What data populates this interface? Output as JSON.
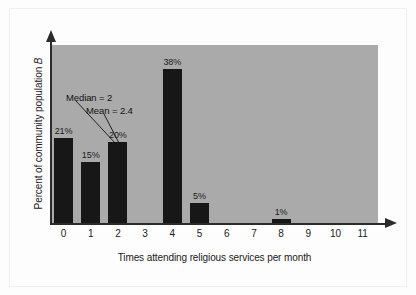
{
  "chart_data": {
    "type": "bar",
    "title": "",
    "xlabel": "Times attending religious services per month",
    "ylabel": "Percent of community population B",
    "ylabel_symbol": "B",
    "categories": [
      "0",
      "1",
      "2",
      "3",
      "4",
      "5",
      "6",
      "7",
      "8",
      "9",
      "10",
      "11"
    ],
    "values": [
      21,
      15,
      20,
      0,
      38,
      5,
      0,
      0,
      1,
      0,
      0,
      0
    ],
    "value_labels": [
      "21%",
      "15%",
      "20%",
      "",
      "38%",
      "5%",
      "",
      "",
      "1%",
      "",
      "",
      ""
    ],
    "ylim": [
      0,
      44
    ],
    "grid": false,
    "legend": "none",
    "annotations": [
      {
        "text": "Median = 2",
        "target_category": "2"
      },
      {
        "text": "Mean = 2.4",
        "target_category": "2"
      }
    ],
    "colors": {
      "bar": "#171717",
      "panel": "#aaaaaa",
      "axis": "#2b2b2b",
      "text": "#1a1a1a",
      "page": "#fdfdfd"
    }
  }
}
